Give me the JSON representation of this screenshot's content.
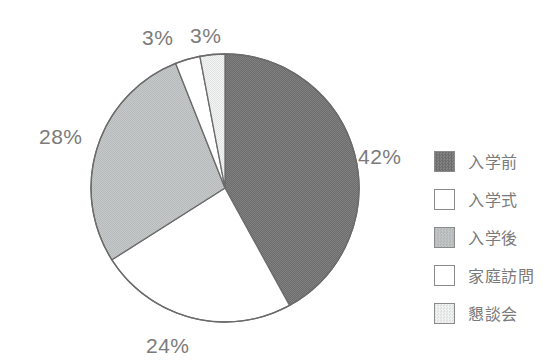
{
  "chart_data": {
    "type": "pie",
    "title": "",
    "subtitle": "",
    "xlabel": "",
    "ylabel": "",
    "legend_position": "right",
    "grid": false,
    "start_angle_deg": 0,
    "direction": "clockwise",
    "categories": [
      "入学前",
      "入学式",
      "入学後",
      "家庭訪問",
      "懇談会"
    ],
    "values": [
      42,
      24,
      28,
      3,
      3
    ],
    "value_labels": [
      "42%",
      "24%",
      "28%",
      "3%",
      "3%"
    ],
    "colors": [
      "#727272",
      "#ffffff",
      "#c3c6c6",
      "#ffffff",
      "#e7e9e9"
    ],
    "slices": [
      {
        "label": "入学前",
        "value": 42,
        "value_label": "42%",
        "color": "#727272",
        "label_x": 358,
        "label_y": 146
      },
      {
        "label": "入学式",
        "value": 24,
        "value_label": "24%",
        "color": "#ffffff",
        "label_x": 146,
        "label_y": 335
      },
      {
        "label": "入学後",
        "value": 28,
        "value_label": "28%",
        "color": "#c3c6c6",
        "label_x": 39,
        "label_y": 126
      },
      {
        "label": "家庭訪問",
        "value": 3,
        "value_label": "3%",
        "color": "#ffffff",
        "label_x": 142,
        "label_y": 27
      },
      {
        "label": "懇談会",
        "value": 3,
        "value_label": "3%",
        "color": "#e7e9e9",
        "label_x": 190,
        "label_y": 25
      }
    ]
  },
  "geometry": {
    "center_x": 225,
    "center_y": 188,
    "radius": 134,
    "outline_color": "#6b6b6b",
    "outline_width": 1.3
  },
  "legend": {
    "items": [
      {
        "label": "入学前",
        "color": "#727272"
      },
      {
        "label": "入学式",
        "color": "#ffffff"
      },
      {
        "label": "入学後",
        "color": "#c3c6c6"
      },
      {
        "label": "家庭訪問",
        "color": "#ffffff"
      },
      {
        "label": "懇談会",
        "color": "#e7e9e9"
      }
    ]
  }
}
